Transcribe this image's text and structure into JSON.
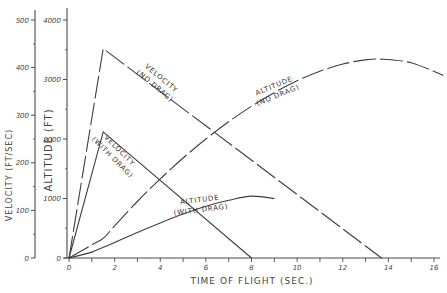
{
  "chart_data": {
    "type": "line",
    "title": "",
    "xlabel": "TIME OF FLIGHT (SEC.)",
    "ylabel_left": "VELOCITY (FT/SEC)",
    "ylabel_right": "ALTITUDE (FT)",
    "xlim": [
      0,
      16
    ],
    "ylim_velocity": [
      0,
      500
    ],
    "ylim_altitude": [
      0,
      4000
    ],
    "x_ticks": [
      "0",
      "2",
      "4",
      "6",
      "8",
      "10",
      "12",
      "14",
      "16"
    ],
    "x_tick_values": [
      0,
      2,
      4,
      6,
      8,
      10,
      12,
      14,
      16
    ],
    "velocity_ticks": [
      "0",
      "100",
      "200",
      "300",
      "400",
      "500"
    ],
    "velocity_tick_values": [
      0,
      100,
      200,
      300,
      400,
      500
    ],
    "altitude_ticks": [
      "0",
      "1000",
      "2000",
      "3000",
      "4000"
    ],
    "altitude_tick_values": [
      0,
      1000,
      2000,
      3000,
      4000
    ],
    "grid": false,
    "series": [
      {
        "name": "VELOCITY (NO DRAG)",
        "label_line1": "VELOCITY",
        "label_line2": "(NO DRAG)",
        "axis": "velocity",
        "style": "dashed",
        "x": [
          0,
          1.5,
          13.7
        ],
        "y": [
          0,
          440,
          0
        ]
      },
      {
        "name": "ALTITUDE (NO DRAG)",
        "label_line1": "ALTITUDE",
        "label_line2": "(NO DRAG)",
        "axis": "altitude",
        "style": "dashed",
        "x": [
          0,
          1,
          1.5,
          2,
          3,
          4,
          5,
          6,
          7,
          8,
          9,
          10,
          11,
          12,
          13,
          13.8,
          15,
          16.4
        ],
        "y": [
          0,
          220,
          330,
          540,
          950,
          1330,
          1680,
          2000,
          2290,
          2550,
          2780,
          2980,
          3140,
          3260,
          3330,
          3340,
          3280,
          3070
        ]
      },
      {
        "name": "VELOCITY (WITH DRAG)",
        "label_line1": "VELOCITY",
        "label_line2": "(WITH DRAG)",
        "axis": "velocity",
        "style": "solid",
        "x": [
          0,
          1.5,
          8
        ],
        "y": [
          0,
          265,
          0
        ]
      },
      {
        "name": "ALTITUDE (WITH DRAG)",
        "label_line1": "ALTITUDE",
        "label_line2": "(WITH DRAG)",
        "axis": "altitude",
        "style": "solid",
        "x": [
          0,
          1,
          1.5,
          2,
          3,
          4,
          5,
          6,
          7,
          8,
          9
        ],
        "y": [
          0,
          100,
          180,
          260,
          430,
          590,
          740,
          870,
          970,
          1040,
          1000
        ]
      }
    ]
  }
}
